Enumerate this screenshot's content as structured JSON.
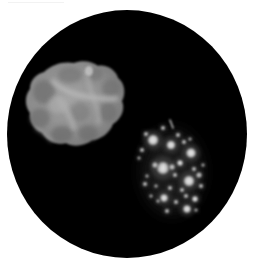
{
  "image": {
    "description": "Grayscale fluorescence micrograph in a circular field of view: a large lobed cell at upper left and a cluster of bright granules at lower right.",
    "background_color": "#ffffff",
    "field_color": "#000000"
  },
  "field_of_view": {
    "shape": "circle",
    "cx": 127,
    "cy": 134,
    "rx": 120,
    "ry": 124
  },
  "objects": {
    "lobed_cell": {
      "label": "large lobed cell",
      "base_color": "#8a8a8a",
      "highlight_color": "#b5b5b5",
      "shadow_color": "#6a6a6a"
    },
    "granule_cluster": {
      "label": "granule cluster",
      "granule_color": "#d9d9d9",
      "haze_color": "#3a3a3a",
      "granules": [
        {
          "x": 153,
          "y": 140,
          "r": 5.5
        },
        {
          "x": 171,
          "y": 145,
          "r": 4.5
        },
        {
          "x": 191,
          "y": 153,
          "r": 5
        },
        {
          "x": 163,
          "y": 168,
          "r": 6.5
        },
        {
          "x": 189,
          "y": 181,
          "r": 5.5
        },
        {
          "x": 164,
          "y": 198,
          "r": 4
        },
        {
          "x": 187,
          "y": 209,
          "r": 4
        },
        {
          "x": 195,
          "y": 199,
          "r": 3
        },
        {
          "x": 180,
          "y": 163,
          "r": 3
        },
        {
          "x": 172,
          "y": 167,
          "r": 2.5
        },
        {
          "x": 146,
          "y": 134,
          "r": 2
        },
        {
          "x": 163,
          "y": 128,
          "r": 2
        },
        {
          "x": 178,
          "y": 135,
          "r": 2
        },
        {
          "x": 184,
          "y": 142,
          "r": 2
        },
        {
          "x": 190,
          "y": 139,
          "r": 1.5
        },
        {
          "x": 142,
          "y": 150,
          "r": 2
        },
        {
          "x": 139,
          "y": 158,
          "r": 1.5
        },
        {
          "x": 155,
          "y": 165,
          "r": 2.5
        },
        {
          "x": 175,
          "y": 175,
          "r": 2
        },
        {
          "x": 199,
          "y": 175,
          "r": 2.5
        },
        {
          "x": 201,
          "y": 186,
          "r": 2
        },
        {
          "x": 194,
          "y": 169,
          "r": 2
        },
        {
          "x": 170,
          "y": 188,
          "r": 2
        },
        {
          "x": 182,
          "y": 190,
          "r": 2
        },
        {
          "x": 156,
          "y": 186,
          "r": 1.5
        },
        {
          "x": 147,
          "y": 176,
          "r": 1.5
        },
        {
          "x": 145,
          "y": 184,
          "r": 2
        },
        {
          "x": 176,
          "y": 202,
          "r": 2
        },
        {
          "x": 167,
          "y": 211,
          "r": 2
        },
        {
          "x": 158,
          "y": 201,
          "r": 1.5
        },
        {
          "x": 186,
          "y": 196,
          "r": 2
        },
        {
          "x": 196,
          "y": 210,
          "r": 1.5
        },
        {
          "x": 151,
          "y": 196,
          "r": 1.5
        },
        {
          "x": 203,
          "y": 165,
          "r": 1.5
        }
      ],
      "streak": {
        "x1": 170,
        "y1": 120,
        "x2": 173,
        "y2": 128
      }
    }
  }
}
